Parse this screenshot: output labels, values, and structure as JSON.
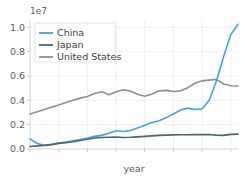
{
  "chart_data": {
    "type": "line",
    "title": "",
    "subtitle": "",
    "xlabel": "year",
    "ylabel": "",
    "y_offset_text": "1e7",
    "y_scale_factor": 10000000,
    "xlim": [
      0,
      29
    ],
    "ylim": [
      0.0,
      1.06
    ],
    "yticks": [
      0.0,
      0.2,
      0.4,
      0.6,
      0.8,
      1.0
    ],
    "ytick_labels": [
      "0.0",
      "0.2",
      "0.4",
      "0.6",
      "0.8",
      "1.0"
    ],
    "xticks": [
      0,
      4,
      8,
      12,
      16,
      20,
      24,
      28
    ],
    "xtick_labels": [
      "",
      "",
      "",
      "",
      "",
      "",
      "",
      ""
    ],
    "grid": true,
    "grid_axis": "both",
    "legend_position": "upper left",
    "legend_entries": [
      "China",
      "Japan",
      "United States"
    ],
    "x": [
      0,
      1,
      2,
      3,
      4,
      5,
      6,
      7,
      8,
      9,
      10,
      11,
      12,
      13,
      14,
      15,
      16,
      17,
      18,
      19,
      20,
      21,
      22,
      23,
      24,
      25,
      26,
      27,
      28,
      29
    ],
    "series": [
      {
        "name": "China",
        "color": "#3ba8dc",
        "values": [
          0.083,
          0.045,
          0.031,
          0.038,
          0.05,
          0.058,
          0.068,
          0.078,
          0.09,
          0.104,
          0.112,
          0.13,
          0.15,
          0.144,
          0.152,
          0.172,
          0.196,
          0.218,
          0.232,
          0.258,
          0.288,
          0.32,
          0.336,
          0.325,
          0.33,
          0.4,
          0.56,
          0.76,
          0.94,
          1.025
        ]
      },
      {
        "name": "Japan",
        "color": "#4a6577",
        "values": [
          0.02,
          0.026,
          0.03,
          0.036,
          0.046,
          0.052,
          0.06,
          0.07,
          0.08,
          0.09,
          0.094,
          0.096,
          0.098,
          0.094,
          0.096,
          0.1,
          0.104,
          0.108,
          0.112,
          0.114,
          0.116,
          0.117,
          0.117,
          0.118,
          0.118,
          0.119,
          0.114,
          0.112,
          0.12,
          0.122
        ]
      },
      {
        "name": "United States",
        "color": "#8c9096",
        "values": [
          0.288,
          0.306,
          0.324,
          0.344,
          0.362,
          0.382,
          0.4,
          0.418,
          0.432,
          0.456,
          0.47,
          0.446,
          0.47,
          0.486,
          0.476,
          0.45,
          0.434,
          0.452,
          0.478,
          0.482,
          0.472,
          0.478,
          0.504,
          0.54,
          0.56,
          0.566,
          0.572,
          0.534,
          0.52,
          0.518
        ]
      }
    ]
  },
  "legend": {
    "items": [
      {
        "label": "China",
        "color": "#3ba8dc"
      },
      {
        "label": "Japan",
        "color": "#4a6577"
      },
      {
        "label": "United States",
        "color": "#8c9096"
      }
    ]
  },
  "axes": {
    "x_axis_label": "year",
    "y_offset_label": "1e7",
    "y_tick_labels": [
      "1.0",
      "0.8",
      "0.6",
      "0.4",
      "0.2",
      "0.0"
    ]
  }
}
